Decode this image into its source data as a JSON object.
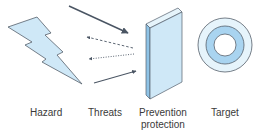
{
  "diagram": {
    "labels": {
      "hazard": "Hazard",
      "threats": "Threats",
      "prevention": "Prevention\nprotection",
      "target": "Target"
    },
    "colors": {
      "fill_light": "#cfe8f7",
      "fill_mid": "#a9d4f0",
      "fill_pale": "#e6f4fb",
      "stroke": "#555f6b",
      "arrow": "#4a5563"
    },
    "elements": [
      "hazard-lightning",
      "solid-arrow-top",
      "dashed-arrow-1",
      "dotted-arrow-2",
      "solid-arrow-bottom",
      "prevention-barrier",
      "target-rings"
    ]
  }
}
